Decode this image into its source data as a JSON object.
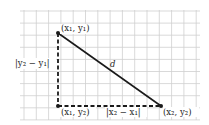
{
  "diagram": {
    "colors": {
      "grid": "#c8c8c8",
      "line": "#1a1a1a",
      "background": "#ffffff"
    },
    "points": {
      "p1": {
        "label": "(x₁, y₁)",
        "x": 58,
        "y": 33
      },
      "corner": {
        "label": "(x₁, y₂)",
        "x": 58,
        "y": 106
      },
      "p2": {
        "label": "(x₂, y₂)",
        "x": 161,
        "y": 106
      }
    },
    "labels": {
      "hypotenuse": "d",
      "vertical_leg": "|y₂ − y₁|",
      "horizontal_leg": "|x₂ − x₁|"
    }
  }
}
